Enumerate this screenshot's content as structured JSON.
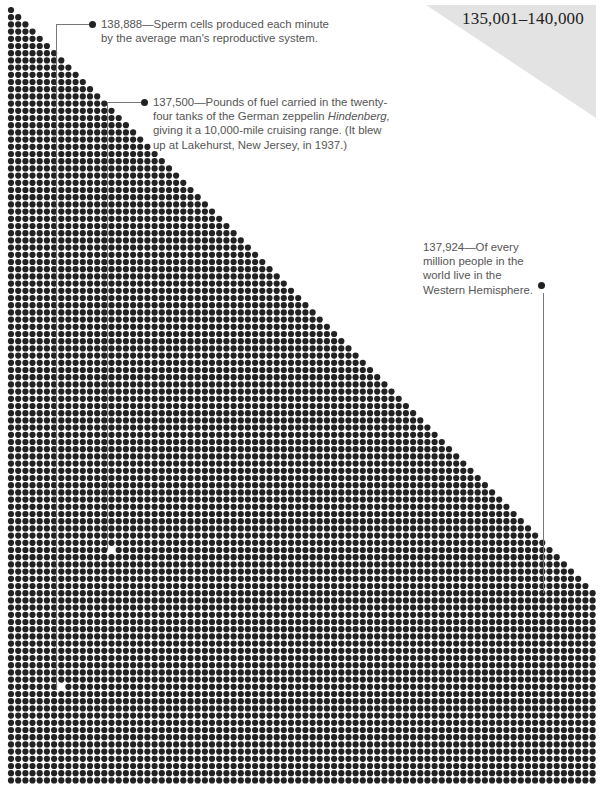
{
  "range_label": "135,001–140,000",
  "colors": {
    "dot": "#222222",
    "range_triangle": "#e3e3e3",
    "text": "#555555",
    "leader_line": "#777777"
  },
  "dot_grid": {
    "origin_x": 11,
    "origin_y": 10,
    "pitch_x": 7.18,
    "pitch_y": 7.2,
    "dot_diameter": 6.2,
    "columns": 82,
    "rows": 108,
    "missing_dots": [
      {
        "x": 114,
        "y": 550
      },
      {
        "x": 63,
        "y": 690
      }
    ]
  },
  "callouts": [
    {
      "number": "138,888",
      "text": "Sperm cells produced each minute by the average man's reproductive system.",
      "line1": "138,888—Sperm cells produced each minute",
      "line2": "by the average man's reproductive system."
    },
    {
      "number": "137,500",
      "line1": "137,500—Pounds of fuel carried in the twenty-",
      "line2_a": "four tanks of the German zeppelin ",
      "line2_em": "Hindenberg,",
      "line3": "giving it a 10,000-mile cruising range. (It blew",
      "line4": "up at Lakehurst, New Jersey, in 1937.)"
    },
    {
      "number": "137,924",
      "line1": "137,924—Of every",
      "line2": "million people in the",
      "line3": "world live in the",
      "line4": "Western Hemisphere."
    }
  ]
}
